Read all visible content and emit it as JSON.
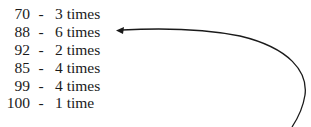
{
  "rows": [
    {
      "value": "70",
      "sep": "-",
      "count": "3 times"
    },
    {
      "value": "88",
      "sep": "-",
      "count": "6 times"
    },
    {
      "value": "92",
      "sep": "-",
      "count": "2 times"
    },
    {
      "value": "85",
      "sep": "-",
      "count": "4 times"
    },
    {
      "value": "99",
      "sep": "-",
      "count": "4 times"
    },
    {
      "value": "100",
      "sep": "-",
      "count": "1 time"
    }
  ],
  "annotation": {
    "type": "curved-arrow",
    "points_to_row": 1,
    "color": "#1a1a1a"
  }
}
